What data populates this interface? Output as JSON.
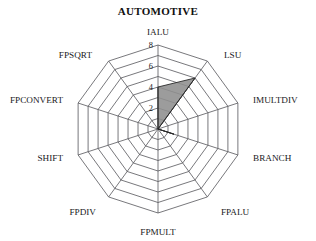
{
  "chart": {
    "title": "AUTOMOTIVE"
  },
  "chart_data": {
    "type": "radar",
    "title": "AUTOMOTIVE",
    "xlabel": "",
    "ylabel": "",
    "categories": [
      "IALU",
      "LSU",
      "IMULTDIV",
      "BRANCH",
      "FPALU",
      "FPMULT",
      "FPDIV",
      "SHIFT",
      "FPCONVERT",
      "FPSQRT"
    ],
    "values": [
      4.0,
      6.0,
      0.0,
      1.6,
      0.0,
      0.0,
      0.0,
      0.0,
      0.0,
      0.0
    ],
    "series": [
      {
        "name": "AUTOMOTIVE",
        "values": [
          4.0,
          6.0,
          0.0,
          1.6,
          0.0,
          0.0,
          0.0,
          0.0,
          0.0,
          0.0
        ]
      }
    ],
    "rmin": 0,
    "rmax": 8,
    "ylim": [
      0,
      8
    ],
    "tick_values": [
      2,
      4,
      6,
      8
    ],
    "tick_labels": [
      "2",
      "4",
      "6",
      "8"
    ],
    "tick_axis": "IALU",
    "rings": [
      1,
      2,
      3,
      4,
      5,
      6,
      7,
      8
    ],
    "grid": true,
    "legend": "none",
    "start_angle_deg": 90,
    "direction": "clockwise",
    "fill_color": "#8e8e8e",
    "line_color": "#2a2a2a",
    "grid_color": "#55555a",
    "background_color": "#ffffff"
  },
  "axis_labels": [
    {
      "text": "IALU",
      "x": 158,
      "y": 35,
      "anchor": "middle"
    },
    {
      "text": "LSU",
      "x": 224,
      "y": 58,
      "anchor": "start"
    },
    {
      "text": "IMULTDIV",
      "x": 253,
      "y": 103,
      "anchor": "start"
    },
    {
      "text": "BRANCH",
      "x": 253,
      "y": 161,
      "anchor": "start"
    },
    {
      "text": "FPALU",
      "x": 221,
      "y": 215,
      "anchor": "start"
    },
    {
      "text": "FPMULT",
      "x": 158,
      "y": 235,
      "anchor": "middle"
    },
    {
      "text": "FPDIV",
      "x": 96,
      "y": 215,
      "anchor": "end"
    },
    {
      "text": "SHIFT",
      "x": 63,
      "y": 161,
      "anchor": "end"
    },
    {
      "text": "FPCONVERT",
      "x": 63,
      "y": 103,
      "anchor": "end"
    },
    {
      "text": "FPSQRT",
      "x": 92,
      "y": 58,
      "anchor": "end"
    }
  ],
  "tick_labels": [
    {
      "text": "8",
      "x": 153,
      "y": 48
    },
    {
      "text": "6",
      "x": 153,
      "y": 69
    },
    {
      "text": "4",
      "x": 153,
      "y": 90
    },
    {
      "text": "2",
      "x": 153,
      "y": 111
    }
  ]
}
